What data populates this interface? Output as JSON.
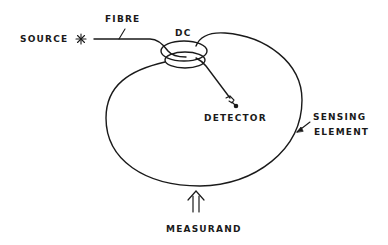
{
  "diagram": {
    "type": "fibre-optic sensor schematic",
    "labels": {
      "source": "SOURCE",
      "fibre": "FIBRE",
      "dc": "DC",
      "detector": "DETECTOR",
      "sensing_line1": "SENSING",
      "sensing_line2": "ELEMENT",
      "measurand": "MEASURAND"
    },
    "icons": {
      "source": "star-burst-icon",
      "measurand": "double-up-arrow-icon",
      "detector": "detector-connector-icon"
    },
    "colors": {
      "ink": "#1a1a1a",
      "background": "#ffffff"
    }
  }
}
